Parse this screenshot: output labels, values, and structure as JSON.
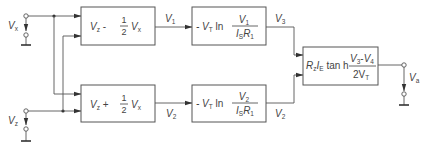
{
  "diagram": {
    "colors": {
      "line": "#555555",
      "text": "#444444",
      "background": "#ffffff"
    },
    "inputs": {
      "vx": {
        "label": "V",
        "sub": "x"
      },
      "vz": {
        "label": "V",
        "sub": "z"
      }
    },
    "blocks": {
      "sub_block": {
        "a": "V",
        "a_sub": "z",
        "op": " - ",
        "num": "1",
        "den": "2",
        "b": "V",
        "b_sub": "x"
      },
      "add_block": {
        "a": "V",
        "a_sub": "z",
        "op": " + ",
        "num": "1",
        "den": "2",
        "b": "V",
        "b_sub": "x"
      },
      "log_top": {
        "prefix": "- V",
        "prefix_sub": "T",
        "fn": " ln ",
        "num": "V",
        "num_sub": "1",
        "den_a": "I",
        "den_a_sub": "S",
        "den_b": "R",
        "den_b_sub": "1"
      },
      "log_bottom": {
        "prefix": "- V",
        "prefix_sub": "T",
        "fn": " ln ",
        "num": "V",
        "num_sub": "2",
        "den_a": "I",
        "den_a_sub": "S",
        "den_b": "R",
        "den_b_sub": "1"
      },
      "tanh_block": {
        "r": "R",
        "r_sub": "z",
        "i": "I",
        "i_sub": "E",
        "fn": " tan h ",
        "num_a": "V",
        "num_a_sub": "3",
        "num_op": "-",
        "num_b": "V",
        "num_b_sub": "4",
        "den": "2V",
        "den_sub": "T"
      }
    },
    "signals": {
      "v1": {
        "label": "V",
        "sub": "1"
      },
      "v2": {
        "label": "V",
        "sub": "2"
      },
      "v3": {
        "label": "V",
        "sub": "3"
      },
      "v4": {
        "label": "V",
        "sub": "2"
      }
    },
    "output": {
      "label": "V",
      "sub": "a"
    }
  }
}
